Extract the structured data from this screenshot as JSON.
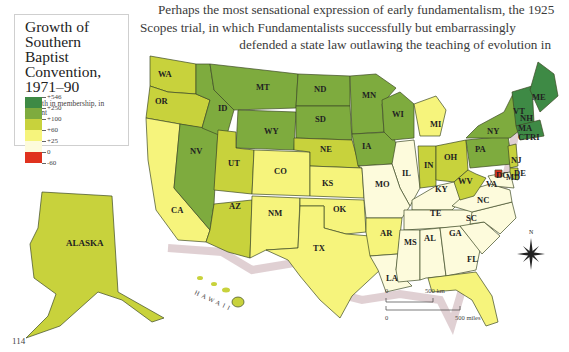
{
  "page": {
    "number": "114",
    "paragraph_lines": [
      "Perhaps the most sensational expression of early fundamentalism, the 1925",
      "Scopes trial, in which Fundamentalists successfully but embarrassingly",
      "defended a state law outlawing the teaching of evolution in"
    ]
  },
  "legend": {
    "title": "Growth of Southern Baptist Convention, 1971–90",
    "subtitle": "Growth in membership, in percent",
    "classes": [
      {
        "label": "+546",
        "color": "#3e8a45"
      },
      {
        "label": "+250",
        "color": "#7eab3e"
      },
      {
        "label": "+100",
        "color": "#c8d23c"
      },
      {
        "label": "+60",
        "color": "#f6f47c"
      },
      {
        "label": "+25",
        "color": "#fdfbdc"
      },
      {
        "label": "0",
        "color": "#e0321e"
      },
      {
        "label": "-60",
        "color": ""
      }
    ]
  },
  "map": {
    "states": {
      "WA": "+100",
      "OR": "+100",
      "CA": "+60",
      "NV": "+250",
      "ID": "+250",
      "MT": "+250",
      "WY": "+250",
      "UT": "+100",
      "AZ": "+100",
      "CO": "+60",
      "NM": "+60",
      "ND": "+250",
      "SD": "+250",
      "NE": "+100",
      "KS": "+60",
      "OK": "+60",
      "TX": "+60",
      "MN": "+250",
      "IA": "+250",
      "WI": "+250",
      "IL": "+25",
      "MO": "+25",
      "AR": "+60",
      "LA": "+25",
      "MI": "+60",
      "IN": "+100",
      "OH": "+100",
      "KY": "+25",
      "TE": "+25",
      "MS": "+25",
      "AL": "+25",
      "GA": "+25",
      "FL": "+60",
      "SC": "+25",
      "NC": "+25",
      "VA": "+25",
      "WV": "+100",
      "PA": "+250",
      "NY": "+250",
      "NJ": "+100",
      "DE": "+100",
      "MD": "+25",
      "DC": "0",
      "VT": "+546",
      "NH": "+546",
      "MA": "+546",
      "CT": "+546",
      "RI": "+546",
      "ME": "+546",
      "ALASKA": "+100",
      "HAWAII": "+100"
    },
    "hawaii_label": "HAWAII",
    "scale_km": {
      "zero": "0",
      "end": "500 km"
    },
    "scale_miles": {
      "zero": "0",
      "end": "500 miles"
    },
    "compass": "N"
  }
}
